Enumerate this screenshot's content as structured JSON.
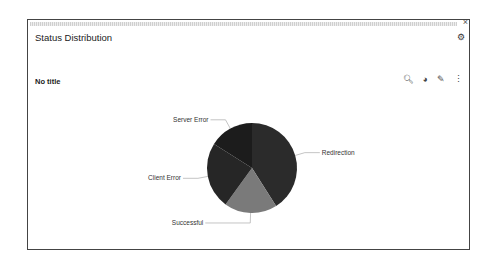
{
  "panel": {
    "title": "Status Distribution",
    "close_icon": "×",
    "settings_icon": "⚙"
  },
  "chart_header": {
    "title": "No title",
    "tools": [
      {
        "name": "search-icon",
        "glyph": "🔍︎"
      },
      {
        "name": "pie-chart-icon",
        "glyph": "◕"
      },
      {
        "name": "edit-icon",
        "glyph": "✎"
      },
      {
        "name": "more-icon",
        "glyph": "⋮"
      }
    ]
  },
  "chart_data": {
    "type": "pie",
    "title": "No title",
    "categories": [
      "Redirection",
      "Successful",
      "Client Error",
      "Server Error"
    ],
    "values": [
      41,
      19,
      24,
      16
    ],
    "colors": [
      "#2b2b2b",
      "#7a7a7a",
      "#262626",
      "#1c1c1c"
    ],
    "legend": "callout labels"
  }
}
